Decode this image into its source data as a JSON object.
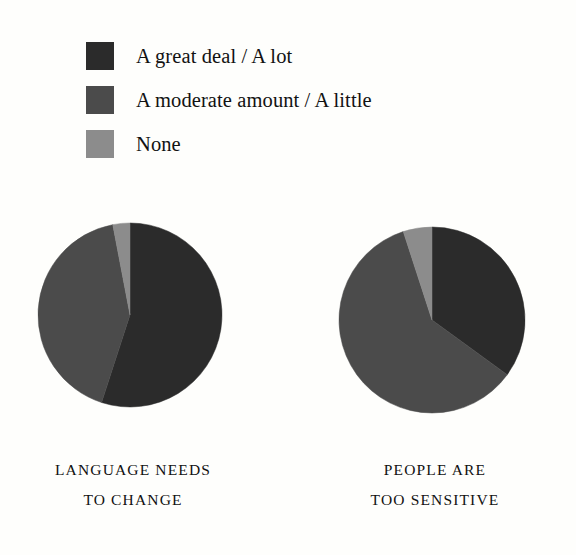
{
  "legend": {
    "items": [
      {
        "label": "A great deal / A lot",
        "color": "#2b2b2b",
        "swatch_name": "legend-swatch-great-deal"
      },
      {
        "label": "A moderate amount / A little",
        "color": "#4b4b4b",
        "swatch_name": "legend-swatch-moderate"
      },
      {
        "label": "None",
        "color": "#8c8c8c",
        "swatch_name": "legend-swatch-none"
      }
    ]
  },
  "captions": {
    "pie1_line1": "LANGUAGE NEEDS",
    "pie1_line2": "TO CHANGE",
    "pie2_line1": "PEOPLE ARE",
    "pie2_line2": "TOO SENSITIVE"
  },
  "chart_data": {
    "type": "pie",
    "title": "",
    "legend_position": "top-left",
    "categories": [
      "A great deal / A lot",
      "A moderate amount / A little",
      "None"
    ],
    "colors": [
      "#2b2b2b",
      "#4b4b4b",
      "#8c8c8c"
    ],
    "start_angle_deg": 0,
    "direction": "clockwise",
    "charts": [
      {
        "name": "language-needs-to-change",
        "label": "LANGUAGE NEEDS TO CHANGE",
        "values": [
          55,
          42,
          3
        ],
        "units": "percent",
        "slice_angles_deg": [
          198,
          151,
          11
        ],
        "cx": 96,
        "cy": 96,
        "r": 92
      },
      {
        "name": "people-are-too-sensitive",
        "label": "PEOPLE ARE TOO SENSITIVE",
        "values": [
          35,
          60,
          5
        ],
        "units": "percent",
        "slice_angles_deg": [
          127,
          216,
          17
        ],
        "cx": 96,
        "cy": 96,
        "r": 93
      }
    ]
  }
}
